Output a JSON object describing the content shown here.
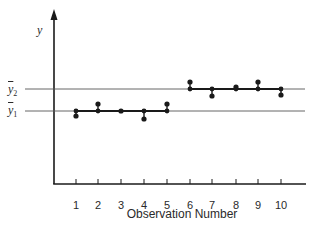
{
  "chart_data": {
    "type": "scatter",
    "title": "",
    "xlabel": "Observation Number",
    "ylabel": "y",
    "categories": [
      "1",
      "2",
      "3",
      "4",
      "5",
      "6",
      "7",
      "8",
      "9",
      "10"
    ],
    "x": [
      1,
      2,
      3,
      4,
      5,
      6,
      7,
      8,
      9,
      10
    ],
    "series": [
      {
        "name": "observations",
        "values": [
          -0.25,
          0.3,
          0.0,
          -0.35,
          0.3,
          1.3,
          0.65,
          1.05,
          1.3,
          0.7
        ]
      }
    ],
    "reference_lines": [
      {
        "name": "y-bar-1",
        "label": "ȳ₁",
        "value": 0.0,
        "segment_x": [
          1,
          5
        ]
      },
      {
        "name": "y-bar-2",
        "label": "ȳ₂",
        "value": 1.0,
        "segment_x": [
          6,
          10
        ]
      }
    ],
    "grid": false,
    "legend": "none",
    "yticks": []
  },
  "axis": {
    "y_label": "y",
    "x_label": "Observation Number",
    "x_ticks": [
      "1",
      "2",
      "3",
      "4",
      "5",
      "6",
      "7",
      "8",
      "9",
      "10"
    ]
  },
  "means": {
    "y2_symbol": "y",
    "y2_sub": "2",
    "y1_symbol": "y",
    "y1_sub": "1"
  },
  "layout": {
    "x_axis_y": 184,
    "y_axis_x": 54,
    "tick_x": [
      76,
      98,
      121,
      144,
      167,
      190,
      212,
      236,
      258,
      281
    ],
    "mean1_y": 111,
    "mean2_y": 89,
    "point_y": [
      116,
      104,
      111,
      119,
      104,
      82,
      96,
      87,
      82,
      95
    ],
    "colors": {
      "ink": "#1a1a1a",
      "thin_line": "#555555"
    }
  }
}
